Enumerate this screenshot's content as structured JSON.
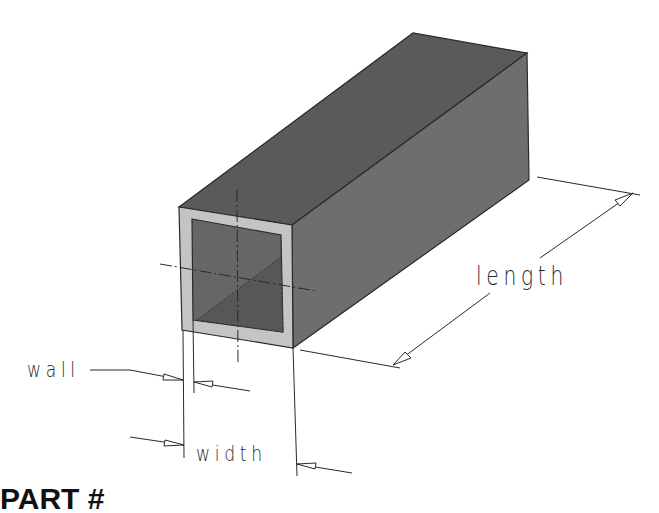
{
  "figure": {
    "labels": {
      "wall": "wall",
      "width": "width",
      "length": "length"
    },
    "caption_partial": "PART  #"
  },
  "colors": {
    "background": "#ffffff",
    "top_face": "#5a5a5a",
    "side_face": "#6e6e6e",
    "inner_face": "#666666",
    "inner_shadow": "#575757",
    "wall_ring": "#c4c4c4",
    "line": "#2a2a2a"
  }
}
